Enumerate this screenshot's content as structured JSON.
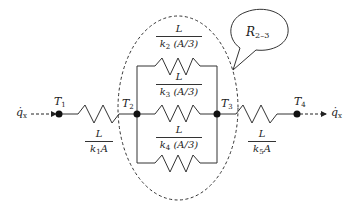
{
  "diagram": {
    "type": "thermal-resistance-network",
    "heat_flow": {
      "symbol": "q̇",
      "subscript": "x"
    },
    "nodes": [
      {
        "id": "T1",
        "symbol": "T",
        "subscript": "1"
      },
      {
        "id": "T2",
        "symbol": "T",
        "subscript": "2"
      },
      {
        "id": "T3",
        "symbol": "T",
        "subscript": "3"
      },
      {
        "id": "T4",
        "symbol": "T",
        "subscript": "4"
      }
    ],
    "resistors": [
      {
        "id": "R1",
        "numerator": "L",
        "k": "k",
        "k_sub": "1",
        "area": "A"
      },
      {
        "id": "R2",
        "numerator": "L",
        "k": "k",
        "k_sub": "2",
        "area": "(A/3)"
      },
      {
        "id": "R3",
        "numerator": "L",
        "k": "k",
        "k_sub": "3",
        "area": "(A/3)"
      },
      {
        "id": "R4",
        "numerator": "L",
        "k": "k",
        "k_sub": "4",
        "area": "(A/3)"
      },
      {
        "id": "R5",
        "numerator": "L",
        "k": "k",
        "k_sub": "5",
        "area": "A"
      }
    ],
    "callout": {
      "symbol": "R",
      "subscript": "2–3"
    }
  }
}
